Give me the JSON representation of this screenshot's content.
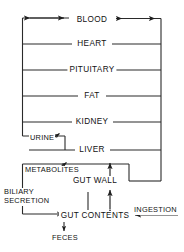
{
  "diagram": {
    "type": "flow-diagram",
    "stroke_color": "#222222",
    "background_color": "#ffffff",
    "text_color": "#111111",
    "width": 184,
    "height": 252,
    "compartments": [
      {
        "id": "blood",
        "label": "BLOOD",
        "x": 92,
        "y": 21,
        "row": 0
      },
      {
        "id": "heart",
        "label": "HEART",
        "x": 92,
        "y": 44,
        "row": 1
      },
      {
        "id": "pituitary",
        "label": "PITUITARY",
        "x": 92,
        "y": 70,
        "row": 2
      },
      {
        "id": "fat",
        "label": "FAT",
        "x": 92,
        "y": 96,
        "row": 3
      },
      {
        "id": "kidney",
        "label": "KIDNEY",
        "x": 92,
        "y": 122,
        "row": 4
      },
      {
        "id": "liver",
        "label": "LIVER",
        "x": 92,
        "y": 150,
        "row": 5
      },
      {
        "id": "gut-wall",
        "label": "GUT WALL",
        "x": 92,
        "y": 180,
        "row": 6
      },
      {
        "id": "gut-contents",
        "label": "GUT CONTENTS",
        "x": 95,
        "y": 215,
        "row": 7
      }
    ],
    "flows": [
      {
        "id": "urine",
        "label": "URINE",
        "x": 38,
        "y": 139,
        "direction": "out",
        "source": "kidney"
      },
      {
        "id": "metabolites",
        "label": "METABOLITES",
        "x": 45,
        "y": 170,
        "direction": "out",
        "source": "liver"
      },
      {
        "id": "biliary-secretion",
        "label": "BILIARY\nSECRETION",
        "line1": "BILIARY",
        "line2": "SECRETION",
        "x": 4,
        "y": 190,
        "direction": "out",
        "source": "liver",
        "target": "gut-contents"
      },
      {
        "id": "ingestion",
        "label": "INGESTION",
        "x": 136,
        "y": 209,
        "direction": "in",
        "target": "gut-contents"
      },
      {
        "id": "feces",
        "label": "FECES",
        "x": 63,
        "y": 238,
        "direction": "out",
        "source": "gut-contents"
      }
    ],
    "arrows": [
      {
        "id": "blood-left-exchange",
        "kind": "double",
        "orientation": "horizontal",
        "note": "arterial/venous exchange left of BLOOD"
      },
      {
        "id": "blood-right-exchange",
        "kind": "double",
        "orientation": "horizontal",
        "note": "arterial/venous exchange right of BLOOD"
      },
      {
        "id": "gutwall-to-liver",
        "kind": "single",
        "orientation": "vertical-up"
      },
      {
        "id": "gutcontents-gutwall",
        "kind": "double",
        "orientation": "vertical"
      },
      {
        "id": "urine-arrow",
        "kind": "single",
        "orientation": "diagonal-up-right"
      },
      {
        "id": "metabolites-arrow",
        "kind": "single",
        "orientation": "diagonal-up-right"
      },
      {
        "id": "biliary-arrow",
        "kind": "single",
        "orientation": "horizontal-right"
      },
      {
        "id": "ingestion-arrow",
        "kind": "single",
        "orientation": "horizontal-left"
      },
      {
        "id": "feces-arrow",
        "kind": "single",
        "orientation": "vertical-down"
      }
    ]
  }
}
